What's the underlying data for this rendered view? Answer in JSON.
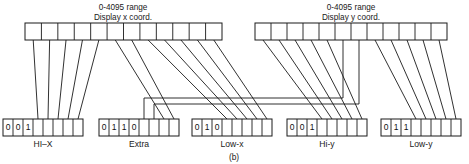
{
  "figure": {
    "caption": "(b)",
    "width": 469,
    "height": 164,
    "line_color": "#1a1a1a",
    "background": "#ffffff"
  },
  "top_registers": [
    {
      "id": "display-x",
      "title_line1": "0-4095 range",
      "title_line2": "Display x coord.",
      "cells": 12,
      "x": 25,
      "y": 23,
      "width": 197,
      "height": 17
    },
    {
      "id": "display-y",
      "title_line1": "0-4095 range",
      "title_line2": "Display y coord.",
      "cells": 12,
      "x": 255,
      "y": 23,
      "width": 192,
      "height": 17
    }
  ],
  "bottom_registers": [
    {
      "id": "hi-x",
      "label": "HI–X",
      "cells": 8,
      "bits": [
        "0",
        "0",
        "1",
        "",
        "",
        "",
        "",
        ""
      ],
      "x": 3,
      "y": 119,
      "width": 80,
      "height": 17
    },
    {
      "id": "extra",
      "label": "Extra",
      "cells": 8,
      "bits": [
        "0",
        "1",
        "1",
        "0",
        "",
        "",
        "",
        ""
      ],
      "x": 99,
      "y": 119,
      "width": 80,
      "height": 17
    },
    {
      "id": "low-x",
      "label": "Low-x",
      "cells": 8,
      "bits": [
        "0",
        "1",
        "0",
        "",
        "",
        "",
        "",
        ""
      ],
      "x": 192,
      "y": 119,
      "width": 80,
      "height": 17
    },
    {
      "id": "hi-y",
      "label": "Hi-y",
      "cells": 8,
      "bits": [
        "0",
        "0",
        "1",
        "",
        "",
        "",
        "",
        ""
      ],
      "x": 287,
      "y": 119,
      "width": 80,
      "height": 17
    },
    {
      "id": "low-y",
      "label": "Low-y",
      "cells": 8,
      "bits": [
        "0",
        "1",
        "1",
        "",
        "",
        "",
        "",
        ""
      ],
      "x": 381,
      "y": 119,
      "width": 80,
      "height": 17
    }
  ],
  "connections": {
    "description": "12-bit display x coordinate distributes to HI-X low 5 bits, Extra bits, and Low-x; 12-bit display y coordinate distributes to Hi-y, Low-y and Extra.",
    "x_routes": [
      {
        "from_bit": 1,
        "to_register": "hi-x",
        "to_bit": 4
      },
      {
        "from_bit": 2,
        "to_register": "hi-x",
        "to_bit": 5
      },
      {
        "from_bit": 3,
        "to_register": "hi-x",
        "to_bit": 6
      },
      {
        "from_bit": 4,
        "to_register": "hi-x",
        "to_bit": 7
      },
      {
        "from_bit": 5,
        "to_register": "hi-x",
        "to_bit": 8
      },
      {
        "from_bit": 6,
        "to_register": "extra",
        "to_bit": 7
      },
      {
        "from_bit": 7,
        "to_register": "extra",
        "to_bit": 8
      },
      {
        "from_bit": 8,
        "to_register": "low-x",
        "to_bit": 4
      },
      {
        "from_bit": 9,
        "to_register": "low-x",
        "to_bit": 5
      },
      {
        "from_bit": 10,
        "to_register": "low-x",
        "to_bit": 6
      },
      {
        "from_bit": 11,
        "to_register": "low-x",
        "to_bit": 7
      },
      {
        "from_bit": 12,
        "to_register": "low-x",
        "to_bit": 8
      }
    ],
    "y_routes": [
      {
        "from_bit": 1,
        "to_register": "hi-y",
        "to_bit": 4
      },
      {
        "from_bit": 2,
        "to_register": "hi-y",
        "to_bit": 5
      },
      {
        "from_bit": 3,
        "to_register": "hi-y",
        "to_bit": 6
      },
      {
        "from_bit": 4,
        "to_register": "hi-y",
        "to_bit": 7
      },
      {
        "from_bit": 5,
        "to_register": "hi-y",
        "to_bit": 8
      },
      {
        "from_bit": 6,
        "to_register": "extra",
        "to_bit": 5
      },
      {
        "from_bit": 7,
        "to_register": "extra",
        "to_bit": 6
      },
      {
        "from_bit": 8,
        "to_register": "low-y",
        "to_bit": 4
      },
      {
        "from_bit": 9,
        "to_register": "low-y",
        "to_bit": 5
      },
      {
        "from_bit": 10,
        "to_register": "low-y",
        "to_bit": 6
      },
      {
        "from_bit": 11,
        "to_register": "low-y",
        "to_bit": 7
      },
      {
        "from_bit": 12,
        "to_register": "low-y",
        "to_bit": 8
      }
    ]
  }
}
